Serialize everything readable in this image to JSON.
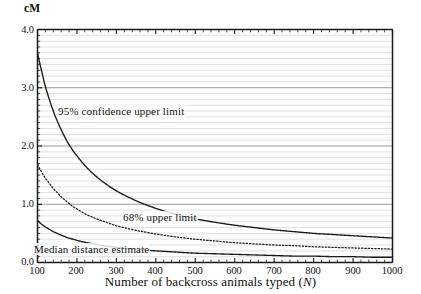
{
  "chart_data": {
    "type": "line",
    "title": "",
    "xlabel": "Number of backcross animals typed (N)",
    "ylabel": "cM",
    "xlim": [
      100,
      1000
    ],
    "ylim": [
      0.0,
      4.0
    ],
    "xticks": [
      100,
      200,
      300,
      400,
      500,
      600,
      700,
      800,
      900,
      1000
    ],
    "yticks": [
      "0.0",
      "1.0",
      "2.0",
      "3.0",
      "4.0"
    ],
    "grid": "horizontal minor gridlines every 0.1 cM, darker lines every 1.0 cM",
    "legend_position": "inline labels on curves",
    "x": [
      100,
      110,
      120,
      130,
      140,
      150,
      160,
      175,
      190,
      200,
      225,
      250,
      275,
      300,
      325,
      350,
      375,
      400,
      450,
      500,
      550,
      600,
      650,
      700,
      750,
      800,
      850,
      900,
      950,
      1000
    ],
    "series": [
      {
        "name": "95% confidence upper limit",
        "style": "solid",
        "values": [
          3.6,
          3.3,
          3.02,
          2.8,
          2.6,
          2.43,
          2.28,
          2.08,
          1.92,
          1.83,
          1.63,
          1.47,
          1.34,
          1.23,
          1.14,
          1.06,
          0.99,
          0.93,
          0.83,
          0.75,
          0.69,
          0.64,
          0.6,
          0.56,
          0.53,
          0.5,
          0.48,
          0.46,
          0.44,
          0.42
        ]
      },
      {
        "name": "68% upper limit",
        "style": "dotted",
        "values": [
          1.68,
          1.56,
          1.45,
          1.36,
          1.27,
          1.2,
          1.13,
          1.04,
          0.96,
          0.92,
          0.82,
          0.75,
          0.69,
          0.63,
          0.59,
          0.55,
          0.52,
          0.49,
          0.44,
          0.4,
          0.37,
          0.34,
          0.32,
          0.3,
          0.29,
          0.27,
          0.26,
          0.25,
          0.24,
          0.23
        ]
      },
      {
        "name": "Median distance estimate",
        "style": "solid",
        "values": [
          0.72,
          0.66,
          0.61,
          0.57,
          0.53,
          0.5,
          0.47,
          0.43,
          0.4,
          0.38,
          0.34,
          0.31,
          0.28,
          0.26,
          0.24,
          0.23,
          0.21,
          0.2,
          0.18,
          0.16,
          0.15,
          0.14,
          0.13,
          0.12,
          0.11,
          0.11,
          0.1,
          0.1,
          0.09,
          0.09
        ]
      }
    ],
    "annotations": [
      {
        "text": "95% confidence upper limit",
        "x": 175,
        "y": 2.35
      },
      {
        "text": "68% upper limit",
        "x": 340,
        "y": 0.83
      },
      {
        "text": "Median distance estimate",
        "x": 110,
        "y": 0.29
      }
    ]
  },
  "axes": {
    "y_unit_label": "cM",
    "y_tick_labels": [
      "4.0",
      "3.0",
      "2.0",
      "1.0",
      "0.0"
    ],
    "x_tick_labels": [
      "100",
      "200",
      "300",
      "400",
      "500",
      "600",
      "700",
      "800",
      "900",
      "1000"
    ],
    "x_title_prefix": "Number of backcross animals typed (",
    "x_title_var": "N",
    "x_title_suffix": ")"
  },
  "colors": {
    "curve": "#1a1a1a",
    "grid_minor": "#d8d8dc",
    "grid_major": "#9a9a9f",
    "axis": "#1a1a1a",
    "background": "#ffffff"
  }
}
